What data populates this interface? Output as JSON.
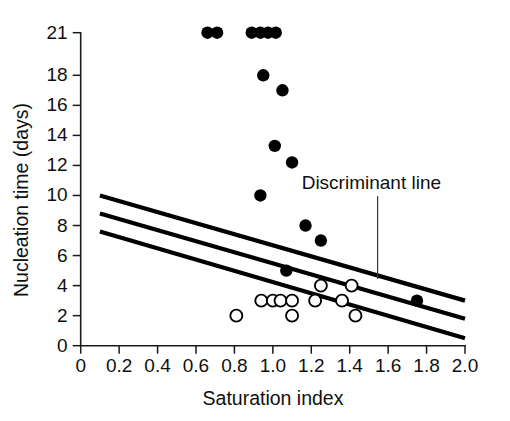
{
  "chart_data": {
    "type": "scatter",
    "title": "",
    "xlabel": "Saturation index",
    "ylabel": "Nucleation time (days)",
    "xlim": [
      0,
      2.0
    ],
    "ylim": [
      0,
      21
    ],
    "grid": false,
    "legend": "none",
    "x_ticks": [
      "0",
      "0.2",
      "0.4",
      "0.6",
      "0.8",
      "1.0",
      "1.2",
      "1.4",
      "1.6",
      "1.8",
      "2.0"
    ],
    "x_tick_values": [
      0,
      0.2,
      0.4,
      0.6,
      0.8,
      1.0,
      1.2,
      1.4,
      1.6,
      1.8,
      2.0
    ],
    "y_ticks": [
      "0",
      "2",
      "4",
      "6",
      "8",
      "10",
      "12",
      "14",
      "16",
      "18",
      "21"
    ],
    "y_tick_values": [
      0,
      2,
      4,
      6,
      8,
      10,
      12,
      14,
      16,
      18,
      21
    ],
    "series": [
      {
        "name": "filled-markers",
        "marker": "filled-circle",
        "color": "#000000",
        "points": [
          [
            0.66,
            21.0
          ],
          [
            0.71,
            21.0
          ],
          [
            0.89,
            21.0
          ],
          [
            0.935,
            21.0
          ],
          [
            0.975,
            21.0
          ],
          [
            1.015,
            21.0
          ],
          [
            0.95,
            18.0
          ],
          [
            1.05,
            17.0
          ],
          [
            1.01,
            13.3
          ],
          [
            1.1,
            12.2
          ],
          [
            0.935,
            10.0
          ],
          [
            1.17,
            8.0
          ],
          [
            1.25,
            7.0
          ],
          [
            1.07,
            5.0
          ],
          [
            1.75,
            3.0
          ]
        ]
      },
      {
        "name": "open-markers",
        "marker": "open-circle",
        "color": "#000000",
        "points": [
          [
            1.25,
            4.0
          ],
          [
            1.41,
            4.0
          ],
          [
            0.94,
            3.0
          ],
          [
            1.0,
            3.0
          ],
          [
            1.04,
            3.0
          ],
          [
            1.1,
            3.0
          ],
          [
            1.22,
            3.0
          ],
          [
            1.36,
            3.0
          ],
          [
            0.81,
            2.0
          ],
          [
            1.1,
            2.0
          ],
          [
            1.43,
            2.0
          ]
        ]
      }
    ],
    "reference_lines": [
      {
        "name": "upper-band-line",
        "x0": 0.1,
        "y0": 10.0,
        "x1": 2.0,
        "y1": 3.0
      },
      {
        "name": "discriminant-line",
        "x0": 0.1,
        "y0": 8.8,
        "x1": 2.0,
        "y1": 1.8
      },
      {
        "name": "lower-band-line",
        "x0": 0.1,
        "y0": 7.6,
        "x1": 2.0,
        "y1": 0.5
      }
    ],
    "annotations": [
      {
        "name": "discriminant-line-label",
        "text": "Discriminant line",
        "label_x": 1.15,
        "label_y": 10.4,
        "leader_from": [
          1.545,
          9.95
        ],
        "leader_to": [
          1.545,
          4.45
        ]
      }
    ]
  }
}
